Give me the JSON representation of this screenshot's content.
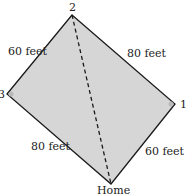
{
  "diagram": {
    "colors": {
      "fill": "#d6d6d6",
      "stroke": "#1a1a1a",
      "base_marker": "#b8b8b8"
    },
    "vertices": {
      "second": {
        "label": "2",
        "x": 72,
        "y": 15
      },
      "third": {
        "label": "3",
        "x": 7,
        "y": 94
      },
      "first": {
        "label": "1",
        "x": 175,
        "y": 104
      },
      "home": {
        "label": "Home",
        "x": 111,
        "y": 184
      }
    },
    "edges": [
      {
        "from": "third",
        "to": "second",
        "label": "60 feet"
      },
      {
        "from": "second",
        "to": "first",
        "label": "80 feet"
      },
      {
        "from": "third",
        "to": "home",
        "label": "80 feet"
      },
      {
        "from": "home",
        "to": "first",
        "label": "60 feet"
      }
    ],
    "diagonal": {
      "from": "second",
      "to": "home",
      "style": "dashed"
    }
  }
}
